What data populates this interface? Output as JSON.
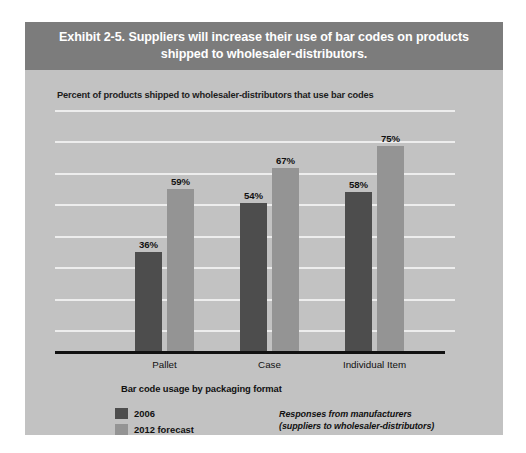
{
  "exhibit": {
    "title": "Exhibit 2-5. Suppliers will increase their use of bar codes on products shipped to wholesaler-distributors.",
    "subtitle": "Percent of products shipped to wholesaler-distributors that use bar codes",
    "note_line1": "Responses from manufacturers",
    "note_line2": "(suppliers to wholesaler-distributors)"
  },
  "colors": {
    "banner": "#7c7c7c",
    "panel": "#c2c2c2",
    "series_2006": "#4d4d4d",
    "series_2012": "#949494",
    "gridline": "#ededed",
    "axis": "#111111"
  },
  "chart_data": {
    "type": "bar",
    "title": "Exhibit 2-5. Suppliers will increase their use of bar codes on products shipped to wholesaler-distributors.",
    "subtitle": "Percent of products shipped to wholesaler-distributors that use bar codes",
    "categories": [
      "Pallet",
      "Case",
      "Individual Item"
    ],
    "series": [
      {
        "name": "2006",
        "color": "#4d4d4d",
        "values": [
          36,
          54,
          58
        ],
        "labels": [
          "36%",
          "54%",
          "58%"
        ]
      },
      {
        "name": "2012 forecast",
        "color": "#949494",
        "values": [
          59,
          67,
          75
        ],
        "labels": [
          "59%",
          "67%",
          "75%"
        ]
      }
    ],
    "xlabel": "Bar code usage by packaging format",
    "ylabel": "",
    "ylim": [
      0,
      88
    ],
    "grid": true,
    "gridline_count": 8,
    "legend_position": "bottom-left",
    "annotations": [
      "Responses from manufacturers",
      "(suppliers to wholesaler-distributors)"
    ],
    "value_suffix": "%"
  }
}
